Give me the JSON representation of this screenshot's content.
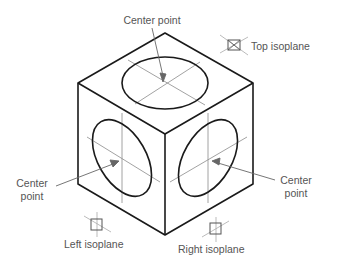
{
  "diagram": {
    "labels": {
      "top_center": "Center point",
      "left_center_line1": "Center",
      "left_center_line2": "point",
      "right_center_line1": "Center",
      "right_center_line2": "point",
      "top_isoplane": "Top isoplane",
      "left_isoplane": "Left isoplane",
      "right_isoplane": "Right isoplane"
    },
    "colors": {
      "edge": "#1a1a1a",
      "centerline": "#8a8a8a",
      "text": "#555555"
    }
  }
}
